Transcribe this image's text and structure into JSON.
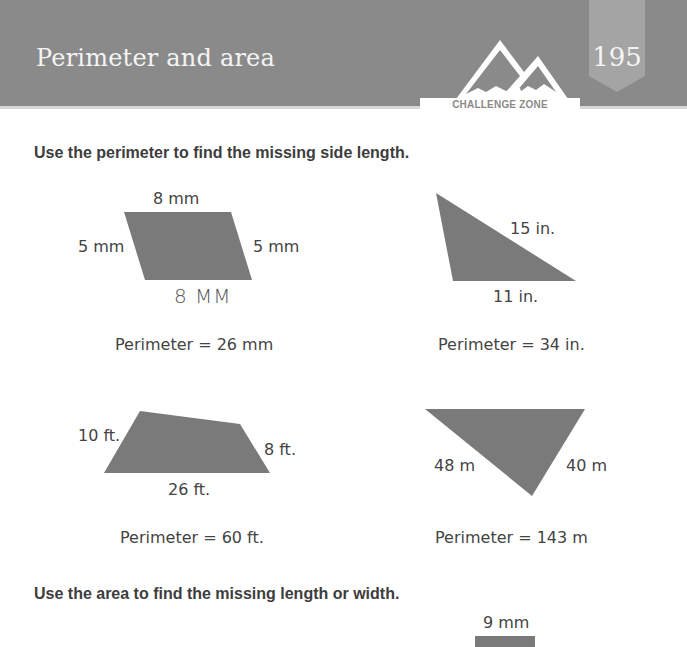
{
  "header": {
    "title": "Perimeter and area",
    "page_number": "195",
    "badge": "CHALLENGE ZONE"
  },
  "section1": {
    "instruction": "Use the perimeter to find the missing side length.",
    "problems": [
      {
        "shape": "parallelogram",
        "labels": {
          "top": "8 mm",
          "left": "5 mm",
          "right": "5 mm"
        },
        "handwritten_answer": "8 MM",
        "perimeter": "Perimeter = 26 mm"
      },
      {
        "shape": "triangle",
        "labels": {
          "hypotenuse": "15 in.",
          "bottom": "11 in."
        },
        "perimeter": "Perimeter = 34 in."
      },
      {
        "shape": "quadrilateral",
        "labels": {
          "left": "10 ft.",
          "right": "8 ft.",
          "bottom": "26 ft."
        },
        "perimeter": "Perimeter = 60 ft."
      },
      {
        "shape": "inverted-triangle",
        "labels": {
          "left": "48 m",
          "right": "40 m"
        },
        "perimeter": "Perimeter = 143 m"
      }
    ]
  },
  "section2": {
    "instruction": "Use the area to find the missing length or width.",
    "problems": [
      {
        "shape": "rectangle",
        "labels": {
          "top": "9 mm"
        }
      }
    ]
  },
  "colors": {
    "header_bg": "#8a8a8a",
    "shape_fill": "#7a7a7a",
    "text": "#444444"
  }
}
